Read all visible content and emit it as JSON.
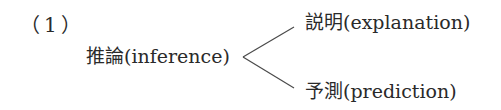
{
  "item_number": "（1）",
  "root": {
    "term": "推論",
    "gloss": "(inference)",
    "text": "推論(inference)"
  },
  "branches": [
    {
      "term": "説明",
      "gloss": "(explanation)",
      "text": "説明(explanation)"
    },
    {
      "term": "予測",
      "gloss": "(prediction)",
      "text": "予測(prediction)"
    }
  ],
  "colors": {
    "text": "#2a2a2a",
    "lines": "#4a4a4a",
    "background": "#ffffff"
  }
}
